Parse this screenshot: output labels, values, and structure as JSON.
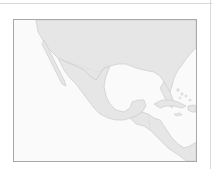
{
  "map": {
    "region": "Mexico, Gulf of Mexico, Central America and the Caribbean",
    "colors": {
      "land": "#e6e6e6",
      "land_stroke": "#cfcfcf",
      "water": "#fafafa",
      "frame": "#a8a8a8",
      "rule": "#d9d9d9",
      "page_background": "#ffffff"
    }
  }
}
